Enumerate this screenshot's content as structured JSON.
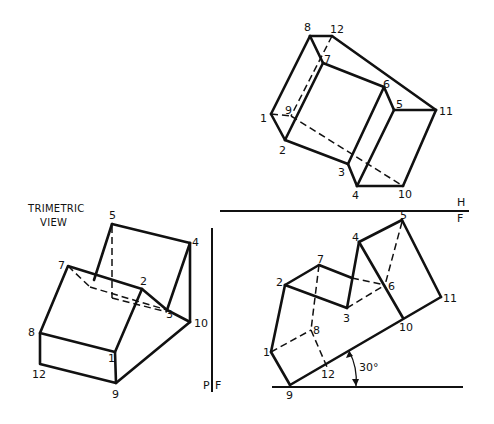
{
  "trimetric": {
    "title_line1": "TRIMETRIC",
    "title_line2": "VIEW",
    "labels": {
      "p1": "1",
      "p2": "2",
      "p3": "3",
      "p4": "4",
      "p5": "5",
      "p7": "7",
      "p8": "8",
      "p9": "9",
      "p10": "10",
      "p12": "12"
    }
  },
  "top_view": {
    "labels": {
      "p1": "1",
      "p2": "2",
      "p3": "3",
      "p4": "4",
      "p5": "5",
      "p6": "6",
      "p7": "7",
      "p8": "8",
      "p9": "9",
      "p10": "10",
      "p11": "11",
      "p12": "12"
    }
  },
  "front_view": {
    "labels": {
      "p1": "1",
      "p2": "2",
      "p3": "3",
      "p4": "4",
      "p5": "5",
      "p6": "6",
      "p7": "7",
      "p8": "8",
      "p9": "9",
      "p10": "10",
      "p11": "11",
      "p12": "12"
    },
    "angle_label": "30°"
  },
  "reference_lines": {
    "h_label": "H",
    "f_label_top": "F",
    "p_label": "P",
    "f_label_side": "F"
  }
}
